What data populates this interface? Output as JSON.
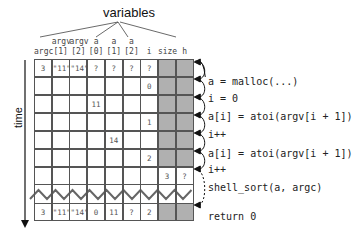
{
  "title": "variables",
  "axis_label": "time",
  "columns": [
    {
      "top": "",
      "bottom": "argc"
    },
    {
      "top": "argv",
      "bottom": "[1]"
    },
    {
      "top": "argv",
      "bottom": "[2]"
    },
    {
      "top": "a",
      "bottom": "[0]"
    },
    {
      "top": "a",
      "bottom": "[1]"
    },
    {
      "top": "a",
      "bottom": "[2]"
    },
    {
      "top": "",
      "bottom": "i"
    },
    {
      "top": "",
      "bottom": "size"
    },
    {
      "top": "",
      "bottom": "h"
    }
  ],
  "rows": [
    [
      "3",
      "\"11\"",
      "\"14\"",
      "?",
      "?",
      "?",
      "?",
      "",
      ""
    ],
    [
      "",
      "",
      "",
      "",
      "",
      "",
      "0",
      "",
      ""
    ],
    [
      "",
      "",
      "",
      "11",
      "",
      "",
      "",
      "",
      ""
    ],
    [
      "",
      "",
      "",
      "",
      "",
      "",
      "1",
      "",
      ""
    ],
    [
      "",
      "",
      "",
      "",
      "14",
      "",
      "",
      "",
      ""
    ],
    [
      "",
      "",
      "",
      "",
      "",
      "",
      "2",
      "",
      ""
    ],
    [
      "",
      "",
      "",
      "",
      "",
      "",
      "",
      "3",
      "?"
    ]
  ],
  "final_row": [
    "3",
    "\"11\"",
    "\"14\"",
    "0",
    "11",
    "?",
    "2",
    "",
    ""
  ],
  "shaded": [
    [
      false,
      false,
      false,
      false,
      false,
      false,
      false,
      true,
      true
    ],
    [
      false,
      false,
      false,
      false,
      false,
      false,
      false,
      true,
      true
    ],
    [
      false,
      false,
      false,
      false,
      false,
      false,
      false,
      true,
      true
    ],
    [
      false,
      false,
      false,
      false,
      false,
      false,
      false,
      true,
      true
    ],
    [
      false,
      false,
      false,
      false,
      false,
      false,
      false,
      true,
      true
    ],
    [
      false,
      false,
      false,
      false,
      false,
      false,
      false,
      true,
      true
    ],
    [
      false,
      false,
      false,
      false,
      false,
      false,
      false,
      false,
      false
    ]
  ],
  "final_shaded": [
    false,
    false,
    false,
    false,
    false,
    false,
    false,
    true,
    true
  ],
  "statements": [
    "a = malloc(...)",
    "i = 0",
    "a[i] = atoi(argv[i + 1])",
    "i++",
    "a[i] = atoi(argv[i + 1])",
    "i++",
    "shell_sort(a, argc)",
    "return 0"
  ],
  "colors": {
    "grid": "#555555",
    "shade": "#b0b0b0",
    "zigzag": "#666666"
  }
}
